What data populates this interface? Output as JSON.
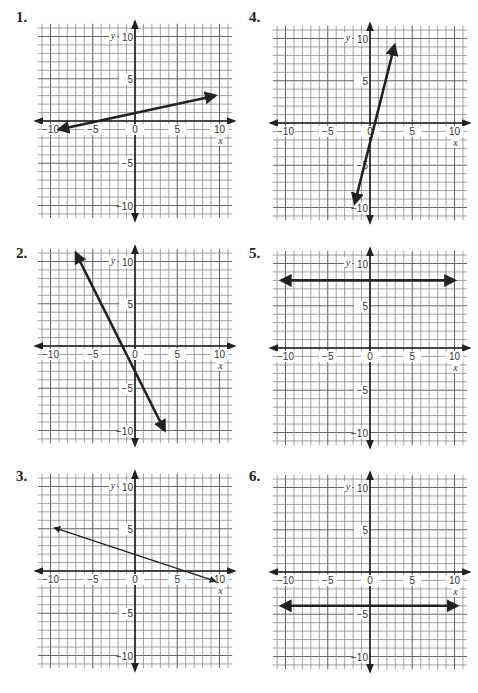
{
  "problems": [
    {
      "number": "1.",
      "equation_line": {
        "x1": -9,
        "y1": -1,
        "x2": 9.5,
        "y2": 3
      }
    },
    {
      "number": "2.",
      "equation_line": {
        "x1": -7,
        "y1": 11,
        "x2": 3.5,
        "y2": -10
      }
    },
    {
      "number": "3.",
      "equation_line": {
        "x1": -9.5,
        "y1": 5.1,
        "x2": 9.5,
        "y2": -1.2
      }
    },
    {
      "number": "4.",
      "equation_line": {
        "x1": -1.8,
        "y1": -9.5,
        "x2": 2.9,
        "y2": 9.2
      }
    },
    {
      "number": "5.",
      "equation_line": {
        "x1": -10.5,
        "y1": 8,
        "x2": 10,
        "y2": 8
      }
    },
    {
      "number": "6.",
      "equation_line": {
        "x1": -10.5,
        "y1": -4,
        "x2": 10.3,
        "y2": -4
      }
    }
  ],
  "axes": {
    "x_label": "x",
    "y_label": "y",
    "x_ticks": [
      "-10",
      "-5",
      "0",
      "5",
      "10"
    ],
    "y_ticks": [
      "10",
      "5",
      "-5",
      "-10"
    ]
  },
  "chart_data": [
    {
      "type": "line",
      "title": "1.",
      "xlabel": "x",
      "ylabel": "y",
      "xlim": [
        -11,
        11
      ],
      "ylim": [
        -11,
        11
      ],
      "grid": true,
      "series": [
        {
          "name": "line 1",
          "x": [
            -9,
            9.5
          ],
          "y": [
            -1,
            3
          ],
          "arrows": "both"
        }
      ]
    },
    {
      "type": "line",
      "title": "2.",
      "xlabel": "x",
      "ylabel": "y",
      "xlim": [
        -11,
        11
      ],
      "ylim": [
        -11,
        11
      ],
      "grid": true,
      "series": [
        {
          "name": "line 2",
          "x": [
            -7,
            3.5
          ],
          "y": [
            11,
            -10
          ],
          "arrows": "both"
        }
      ]
    },
    {
      "type": "line",
      "title": "3.",
      "xlabel": "x",
      "ylabel": "y",
      "xlim": [
        -11,
        11
      ],
      "ylim": [
        -11,
        11
      ],
      "grid": true,
      "series": [
        {
          "name": "line 3",
          "x": [
            -9.5,
            9.5
          ],
          "y": [
            5.1,
            -1.2
          ],
          "arrows": "both"
        }
      ]
    },
    {
      "type": "line",
      "title": "4.",
      "xlabel": "x",
      "ylabel": "y",
      "xlim": [
        -11,
        11
      ],
      "ylim": [
        -11,
        11
      ],
      "grid": true,
      "series": [
        {
          "name": "line 4",
          "x": [
            -1.8,
            2.9
          ],
          "y": [
            -9.5,
            9.2
          ],
          "arrows": "both"
        }
      ]
    },
    {
      "type": "line",
      "title": "5.",
      "xlabel": "x",
      "ylabel": "y",
      "xlim": [
        -11,
        11
      ],
      "ylim": [
        -11,
        11
      ],
      "grid": true,
      "series": [
        {
          "name": "line 5",
          "x": [
            -10.5,
            10
          ],
          "y": [
            8,
            8
          ],
          "arrows": "both"
        }
      ]
    },
    {
      "type": "line",
      "title": "6.",
      "xlabel": "x",
      "ylabel": "y",
      "xlim": [
        -11,
        11
      ],
      "ylim": [
        -11,
        11
      ],
      "grid": true,
      "series": [
        {
          "name": "line 6",
          "x": [
            -10.5,
            10.3
          ],
          "y": [
            -4,
            -4
          ],
          "arrows": "both"
        }
      ]
    }
  ]
}
